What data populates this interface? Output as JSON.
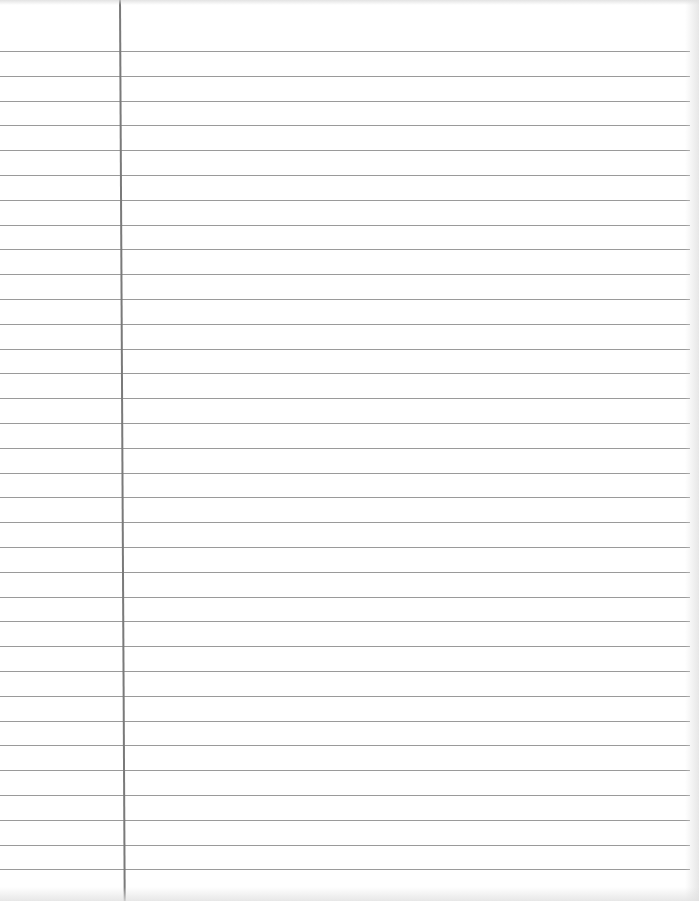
{
  "paper": {
    "type": "lined-paper",
    "line_count": 34,
    "first_line_y": 51,
    "line_spacing": 24.8,
    "margin_x": 119,
    "line_color": "#9a9a9a",
    "margin_color": "#7a7a7a",
    "background": "#ffffff"
  }
}
